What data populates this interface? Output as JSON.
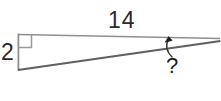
{
  "figure": {
    "kind": "geometry-diagram",
    "shape": "right-triangle",
    "background_color": "#ffffff",
    "stroke_color": "#8a8a8a",
    "hypotenuse_color": "#5d5d5d",
    "annotation_color": "#1d1d1d",
    "labels": {
      "vertical_side": "2",
      "horizontal_side": "14",
      "unknown_angle": "?"
    },
    "markers": {
      "right_angle": "right-angle-square",
      "leader": "curved-arrow-pointing-to-angle"
    },
    "geometry": {
      "top_left_vertex": [
        18,
        34
      ],
      "bottom_left_vertex": [
        18,
        70
      ],
      "right_vertex": [
        220,
        40
      ],
      "right_angle_square_size": 13,
      "arrow_tip": [
        168,
        38
      ],
      "leader_curve_start": [
        172,
        56
      ]
    }
  }
}
